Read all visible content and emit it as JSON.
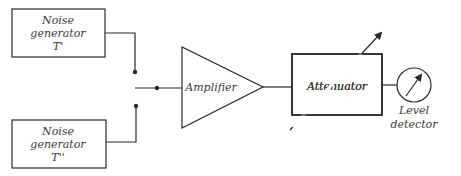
{
  "diagram": {
    "type": "block-diagram",
    "blocks": {
      "noise_gen_1": {
        "lines": [
          "Noise",
          "generator",
          "T'"
        ]
      },
      "noise_gen_2": {
        "lines": [
          "Noise",
          "generator",
          "T''"
        ]
      },
      "amplifier": {
        "label": "Amplifier"
      },
      "attenuator": {
        "label": "Attenuator"
      },
      "level_detector": {
        "lines": [
          "Level",
          "detector"
        ]
      }
    },
    "colors": {
      "stroke": "#2a2a2a",
      "text": "#3a3a3a",
      "background": "#ffffff"
    }
  }
}
